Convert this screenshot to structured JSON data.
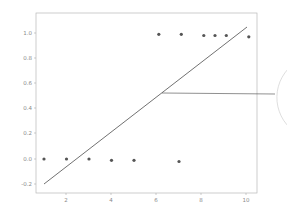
{
  "chart_data": {
    "type": "scatter",
    "title": "",
    "xlabel": "",
    "ylabel": "",
    "xlim": [
      0.6,
      10.4
    ],
    "ylim": [
      -0.27,
      1.15
    ],
    "grid": false,
    "legend": null,
    "x_ticks": [
      "2",
      "4",
      "6",
      "8",
      "10"
    ],
    "y_ticks": [
      "-0.2",
      "0.0",
      "0.2",
      "0.4",
      "0.6",
      "0.8",
      "1.0"
    ],
    "series": [
      {
        "name": "observations",
        "type": "scatter",
        "color": "#555555",
        "x": [
          1,
          2,
          3,
          4,
          5,
          7,
          6.1,
          7.1,
          8.1,
          8.6,
          9.1,
          10.1
        ],
        "y": [
          0.0,
          0.0,
          0.0,
          -0.01,
          -0.01,
          -0.02,
          0.99,
          0.99,
          0.98,
          0.98,
          0.98,
          0.97
        ]
      },
      {
        "name": "linear fit",
        "type": "line",
        "color": "#333333",
        "x": [
          1,
          10
        ],
        "y": [
          -0.2,
          1.05
        ]
      }
    ],
    "annotations": [
      {
        "type": "callout-line",
        "description": "horizontal leader line from the fit line at y≈0.52 extending right to a partial circle outside the plot area",
        "y": 0.52
      }
    ]
  },
  "axes": {
    "x_ticks": [
      {
        "label": "2"
      },
      {
        "label": "4"
      },
      {
        "label": "6"
      },
      {
        "label": "8"
      },
      {
        "label": "10"
      }
    ],
    "y_ticks": [
      {
        "label": "1.0"
      },
      {
        "label": "0.8"
      },
      {
        "label": "0.6"
      },
      {
        "label": "0.4"
      },
      {
        "label": "0.2"
      },
      {
        "label": "0.0"
      },
      {
        "label": "-0.2"
      }
    ]
  }
}
